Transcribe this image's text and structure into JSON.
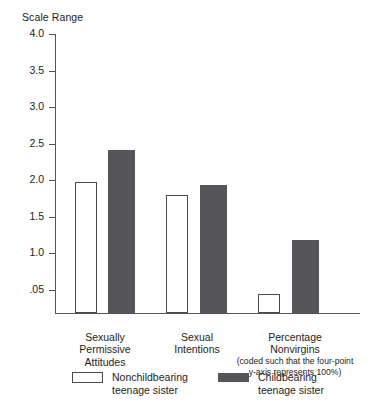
{
  "chart_data": {
    "type": "bar",
    "title": "Scale Range",
    "xlabel": "",
    "ylabel": "Scale Range",
    "grid": false,
    "legend_position": "bottom",
    "ylim": [
      0.05,
      4.0
    ],
    "ytick_labels": [
      "4.0",
      "3.5",
      "3.0",
      "2.5",
      "2.0",
      "1.5",
      "1.0",
      ".05"
    ],
    "ytick_values": [
      4.0,
      3.5,
      3.0,
      2.5,
      2.0,
      1.5,
      1.0,
      0.05
    ],
    "categories": [
      "Sexually\nPermissive\nAttitudes",
      "Sexual\nIntentions",
      "Percentage\nNonvirgins"
    ],
    "category_notes": [
      "",
      "",
      "(coded such that the four-point\ny-axis represents 100%)"
    ],
    "series": [
      {
        "name": "Nonchildbearing\nteenage sister",
        "color": "#ffffff",
        "values": [
          1.88,
          1.69,
          0.27
        ]
      },
      {
        "name": "Childbearing\nteenage sister",
        "color": "#56565a",
        "values": [
          2.33,
          1.84,
          1.04
        ]
      }
    ]
  },
  "legend": {
    "items": [
      {
        "label": "Nonchildbearing\nteenage sister",
        "swatch": "legend-swatch-light"
      },
      {
        "label": "Childbearing\nteenage sister",
        "swatch": "legend-swatch-dark"
      }
    ]
  }
}
